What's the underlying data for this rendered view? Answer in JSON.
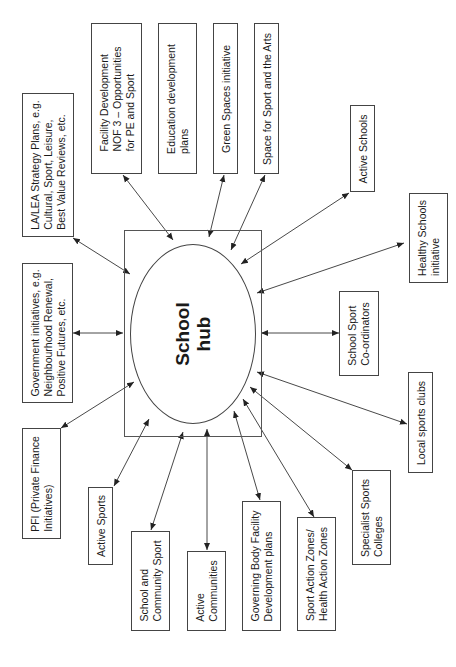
{
  "diagram": {
    "orientation": "rotated -90deg (landscape page shown in portrait)",
    "hub": {
      "label": "School\nhub"
    },
    "nodes": [
      {
        "id": "la-lea",
        "label": "LA/LEA Strategy Plans, e.g.\nCultural, Sport, Leisure,\nBest Value Reviews, etc.",
        "arrow": "bidirectional"
      },
      {
        "id": "facility-dev",
        "label": "Facility Development\nNOF 3 – Opportunities\nfor PE and Sport",
        "arrow": "bidirectional"
      },
      {
        "id": "education-dev",
        "label": "Education development\nplans",
        "arrow": "none"
      },
      {
        "id": "green-spaces",
        "label": "Green Spaces initiative",
        "arrow": "bidirectional"
      },
      {
        "id": "space-sport-arts",
        "label": "Space for Sport and the Arts",
        "arrow": "bidirectional"
      },
      {
        "id": "active-schools",
        "label": "Active Schools",
        "arrow": "bidirectional"
      },
      {
        "id": "healthy-schools",
        "label": "Healthy Schools\ninitiative",
        "arrow": "bidirectional"
      },
      {
        "id": "school-sport-coord",
        "label": "School Sport\nCo-ordinators",
        "arrow": "bidirectional"
      },
      {
        "id": "local-sports-clubs",
        "label": "Local sports clubs",
        "arrow": "bidirectional"
      },
      {
        "id": "specialist-sports",
        "label": "Specialist Sports\nColleges",
        "arrow": "bidirectional"
      },
      {
        "id": "sport-action-zones",
        "label": "Sport Action Zones/\nHealth Action Zones",
        "arrow": "bidirectional"
      },
      {
        "id": "governing-body",
        "label": "Governing Body Facility\nDevelopment plans",
        "arrow": "bidirectional"
      },
      {
        "id": "active-communities",
        "label": "Active\nCommunities",
        "arrow": "bidirectional"
      },
      {
        "id": "school-community-sport",
        "label": "School and\nCommunity Sport",
        "arrow": "bidirectional"
      },
      {
        "id": "active-sports",
        "label": "Active Sports",
        "arrow": "bidirectional"
      },
      {
        "id": "pfi",
        "label": "PFI (Private Finance\nInitiatives)",
        "arrow": "bidirectional"
      },
      {
        "id": "government-initiatives",
        "label": "Government initiatives, e.g.\nNeighbourhood Renewal,\nPositive Futures, etc.",
        "arrow": "bidirectional"
      }
    ]
  }
}
